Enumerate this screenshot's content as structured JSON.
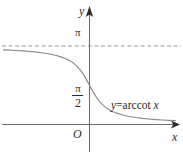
{
  "figure": {
    "background_color": "#ffffff",
    "width": 183,
    "height": 160
  },
  "axes": {
    "y_axis_label": "y",
    "x_axis_label": "x",
    "origin_label": "O",
    "axis_color": "#6e6e6e",
    "arrow_color": "#2b2b2b"
  },
  "ticks": {
    "pi": "π",
    "pi_half_numerator": "π",
    "pi_half_denominator": "2"
  },
  "annotations": {
    "curve_equation_prefix": "y",
    "curve_equation_equals": "=arccot ",
    "curve_equation_variable": "x",
    "curve_equation_full": "y=arccot x"
  },
  "asymptote": {
    "label": "π",
    "style": "dashed",
    "color": "#9a9a9a"
  },
  "chart_data": {
    "type": "line",
    "title": "",
    "subtitle": "",
    "xlabel": "x",
    "ylabel": "y",
    "function": "y=arccot x",
    "legend": [
      "y=arccot x"
    ],
    "legend_position": "inline-right",
    "grid": false,
    "xlim": [
      -6.5,
      6.5
    ],
    "ylim": [
      -0.35,
      3.75
    ],
    "yticks": [
      1.5707963,
      3.1415927
    ],
    "ytick_labels": [
      "π/2",
      "π"
    ],
    "xticks": [
      0
    ],
    "xtick_labels": [
      "O"
    ],
    "asymptotes": [
      {
        "type": "horizontal",
        "y": 3.1415927,
        "label": "π",
        "style": "dashed"
      },
      {
        "type": "horizontal",
        "y": 0,
        "label": "",
        "style": "solid"
      }
    ],
    "series": [
      {
        "name": "y=arccot x",
        "color": "#8a8a8a",
        "x": [
          -6.5,
          -6.0,
          -5.5,
          -5.0,
          -4.5,
          -4.0,
          -3.5,
          -3.0,
          -2.5,
          -2.0,
          -1.75,
          -1.5,
          -1.25,
          -1.0,
          -0.75,
          -0.5,
          -0.25,
          0.0,
          0.25,
          0.5,
          0.75,
          1.0,
          1.25,
          1.5,
          1.75,
          2.0,
          2.5,
          3.0,
          3.5,
          4.0,
          4.5,
          5.0,
          5.5,
          6.0,
          6.5
        ],
        "y": [
          2.989,
          2.976,
          2.962,
          2.944,
          2.923,
          2.897,
          2.863,
          2.82,
          2.761,
          2.678,
          2.623,
          2.556,
          2.475,
          2.356,
          2.214,
          2.034,
          1.816,
          1.571,
          1.326,
          1.107,
          0.927,
          0.785,
          0.675,
          0.588,
          0.519,
          0.464,
          0.381,
          0.322,
          0.278,
          0.245,
          0.219,
          0.197,
          0.18,
          0.165,
          0.153
        ]
      }
    ]
  }
}
